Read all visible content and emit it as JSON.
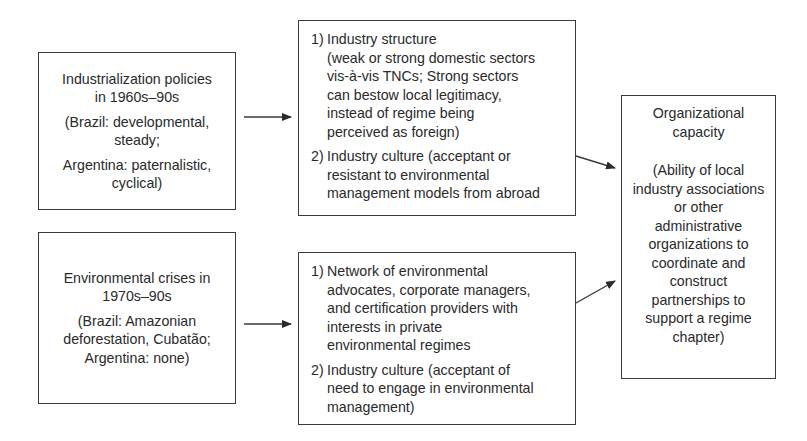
{
  "diagram": {
    "left_top": {
      "title_lines": [
        "Industrialization policies",
        "in 1960s–90s"
      ],
      "detail_lines": [
        "(Brazil: developmental,",
        "steady;"
      ],
      "detail2_lines": [
        "Argentina: paternalistic,",
        "cyclical)"
      ]
    },
    "left_bottom": {
      "title_lines": [
        "Environmental crises in",
        "1970s–90s"
      ],
      "detail_lines": [
        "(Brazil: Amazonian",
        "deforestation, Cubatão;",
        "Argentina: none)"
      ]
    },
    "mid_top": {
      "items": [
        {
          "num": "1)",
          "first": "Industry structure",
          "rest": [
            "(weak or strong domestic sectors",
            "vis-à-vis TNCs; Strong sectors",
            "can bestow local legitimacy,",
            "instead of regime being",
            "perceived as foreign)"
          ]
        },
        {
          "num": "2)",
          "first": "Industry culture (acceptant or",
          "rest": [
            "resistant to environmental",
            "management models from abroad"
          ]
        }
      ]
    },
    "mid_bottom": {
      "items": [
        {
          "num": "1)",
          "first": "Network of environmental",
          "rest": [
            "advocates, corporate managers,",
            "and certification providers with",
            "interests in private",
            "environmental regimes"
          ]
        },
        {
          "num": "2)",
          "first": "Industry culture (acceptant of",
          "rest": [
            "need to engage in environmental",
            "management)"
          ]
        }
      ]
    },
    "right": {
      "title_lines": [
        "Organizational",
        "capacity"
      ],
      "detail_lines": [
        "(Ability of local",
        "industry associations",
        "or other",
        "administrative",
        "organizations to",
        "coordinate and",
        "construct",
        "partnerships to",
        "support a regime",
        "chapter)"
      ]
    },
    "colors": {
      "stroke": "#3a3a3a",
      "text": "#2a2a2a",
      "background": "#ffffff"
    }
  }
}
